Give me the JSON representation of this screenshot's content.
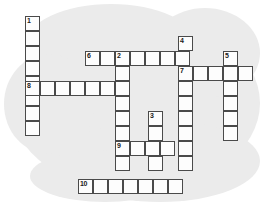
{
  "puzzle": {
    "title": "Crossword Puzzle Grid",
    "cell_size": 15,
    "grid_colors": {
      "cell_fill": "#fdfdfd",
      "cell_border": "#4a4a4a",
      "background_blob": "#ebebeb",
      "page_background": "#ffffff",
      "number_color": "#1a1a1a"
    },
    "numbers": [
      "1",
      "2",
      "3",
      "4",
      "5",
      "6",
      "7",
      "8",
      "9",
      "10"
    ],
    "entries": [
      {
        "number": "1",
        "direction": "down",
        "x": 25,
        "y": 16,
        "length": 8
      },
      {
        "number": "2",
        "direction": "down",
        "x": 115,
        "y": 51,
        "length": 8
      },
      {
        "number": "3",
        "direction": "down",
        "x": 148,
        "y": 111,
        "length": 5
      },
      {
        "number": "4",
        "direction": "down",
        "x": 178,
        "y": 36,
        "length": 9
      },
      {
        "number": "5",
        "direction": "down",
        "x": 223,
        "y": 51,
        "length": 6
      },
      {
        "number": "6",
        "direction": "across",
        "x": 85,
        "y": 51,
        "length": 7
      },
      {
        "number": "7",
        "direction": "across",
        "x": 178,
        "y": 66,
        "length": 5
      },
      {
        "number": "8",
        "direction": "across",
        "x": 25,
        "y": 81,
        "length": 7
      },
      {
        "number": "9",
        "direction": "across",
        "x": 115,
        "y": 141,
        "length": 4
      },
      {
        "number": "10",
        "direction": "across",
        "x": 78,
        "y": 179,
        "length": 7
      }
    ],
    "cells": [
      {
        "x": 25,
        "y": 16,
        "number": "1"
      },
      {
        "x": 25,
        "y": 31,
        "number": ""
      },
      {
        "x": 25,
        "y": 46,
        "number": ""
      },
      {
        "x": 25,
        "y": 61,
        "number": ""
      },
      {
        "x": 25,
        "y": 76,
        "number": ""
      },
      {
        "x": 25,
        "y": 91,
        "number": ""
      },
      {
        "x": 25,
        "y": 106,
        "number": ""
      },
      {
        "x": 25,
        "y": 121,
        "number": ""
      },
      {
        "x": 85,
        "y": 51,
        "number": "6"
      },
      {
        "x": 100,
        "y": 51,
        "number": ""
      },
      {
        "x": 115,
        "y": 51,
        "number": "2"
      },
      {
        "x": 130,
        "y": 51,
        "number": ""
      },
      {
        "x": 145,
        "y": 51,
        "number": ""
      },
      {
        "x": 160,
        "y": 51,
        "number": ""
      },
      {
        "x": 175,
        "y": 51,
        "number": ""
      },
      {
        "x": 178,
        "y": 36,
        "number": "4"
      },
      {
        "x": 223,
        "y": 51,
        "number": "5"
      },
      {
        "x": 178,
        "y": 66,
        "number": "7"
      },
      {
        "x": 193,
        "y": 66,
        "number": ""
      },
      {
        "x": 208,
        "y": 66,
        "number": ""
      },
      {
        "x": 223,
        "y": 66,
        "number": ""
      },
      {
        "x": 238,
        "y": 66,
        "number": ""
      },
      {
        "x": 25,
        "y": 81,
        "number": "8"
      },
      {
        "x": 40,
        "y": 81,
        "number": ""
      },
      {
        "x": 55,
        "y": 81,
        "number": ""
      },
      {
        "x": 70,
        "y": 81,
        "number": ""
      },
      {
        "x": 85,
        "y": 81,
        "number": ""
      },
      {
        "x": 100,
        "y": 81,
        "number": ""
      },
      {
        "x": 115,
        "y": 81,
        "number": ""
      },
      {
        "x": 115,
        "y": 66,
        "number": ""
      },
      {
        "x": 115,
        "y": 96,
        "number": ""
      },
      {
        "x": 115,
        "y": 111,
        "number": ""
      },
      {
        "x": 115,
        "y": 126,
        "number": ""
      },
      {
        "x": 115,
        "y": 141,
        "number": "9"
      },
      {
        "x": 115,
        "y": 156,
        "number": ""
      },
      {
        "x": 130,
        "y": 141,
        "number": ""
      },
      {
        "x": 145,
        "y": 141,
        "number": ""
      },
      {
        "x": 160,
        "y": 141,
        "number": ""
      },
      {
        "x": 148,
        "y": 111,
        "number": "3"
      },
      {
        "x": 148,
        "y": 126,
        "number": ""
      },
      {
        "x": 148,
        "y": 156,
        "number": ""
      },
      {
        "x": 178,
        "y": 81,
        "number": ""
      },
      {
        "x": 178,
        "y": 96,
        "number": ""
      },
      {
        "x": 178,
        "y": 111,
        "number": ""
      },
      {
        "x": 178,
        "y": 126,
        "number": ""
      },
      {
        "x": 178,
        "y": 141,
        "number": ""
      },
      {
        "x": 178,
        "y": 156,
        "number": ""
      },
      {
        "x": 223,
        "y": 81,
        "number": ""
      },
      {
        "x": 223,
        "y": 96,
        "number": ""
      },
      {
        "x": 223,
        "y": 111,
        "number": ""
      },
      {
        "x": 223,
        "y": 126,
        "number": ""
      },
      {
        "x": 78,
        "y": 179,
        "number": "10"
      },
      {
        "x": 93,
        "y": 179,
        "number": ""
      },
      {
        "x": 108,
        "y": 179,
        "number": ""
      },
      {
        "x": 123,
        "y": 179,
        "number": ""
      },
      {
        "x": 138,
        "y": 179,
        "number": ""
      },
      {
        "x": 153,
        "y": 179,
        "number": ""
      },
      {
        "x": 168,
        "y": 179,
        "number": ""
      }
    ]
  }
}
